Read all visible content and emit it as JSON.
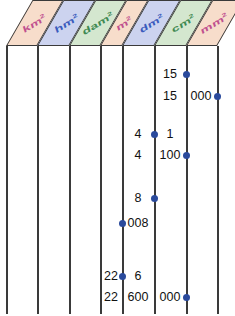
{
  "figure": {
    "dot_color": "#2a4a9c",
    "line_color": "#3a3a3a",
    "text_color": "#111111"
  },
  "header": {
    "units": [
      {
        "id": "km2",
        "base": "km",
        "exponent": "2",
        "fill": "#f7ddcb",
        "text_color": "#c0508f"
      },
      {
        "id": "hm2",
        "base": "hm",
        "exponent": "2",
        "fill": "#ccd3ef",
        "text_color": "#3a5bbd"
      },
      {
        "id": "dam2",
        "base": "dam",
        "exponent": "2",
        "fill": "#d4e7cf",
        "text_color": "#3f8a52"
      },
      {
        "id": "m2",
        "base": "m",
        "exponent": "2",
        "fill": "#f7ddcb",
        "text_color": "#c0508f"
      },
      {
        "id": "dm2",
        "base": "dm",
        "exponent": "2",
        "fill": "#ccd3ef",
        "text_color": "#3a5bbd"
      },
      {
        "id": "cm2",
        "base": "cm",
        "exponent": "2",
        "fill": "#d4e7cf",
        "text_color": "#3f8a52"
      },
      {
        "id": "mm2",
        "base": "mm",
        "exponent": "2",
        "fill": "#f7ddcb",
        "text_color": "#c0508f"
      }
    ]
  },
  "grid": {
    "column_line_x": [
      6,
      37,
      69,
      100,
      122,
      154,
      186,
      217
    ],
    "column_centers": [
      21,
      53,
      84,
      111,
      138,
      170,
      201
    ]
  },
  "rows": [
    {
      "id": "row-15",
      "y": 20,
      "cells": [
        {
          "text": "15",
          "x": 170
        }
      ],
      "dot_x": 186
    },
    {
      "id": "row-15-000",
      "y": 42,
      "cells": [
        {
          "text": "15",
          "x": 170
        },
        {
          "text": "000",
          "x": 201
        }
      ],
      "dot_x": 217
    },
    {
      "id": "row-4-1",
      "y": 80,
      "cells": [
        {
          "text": "4",
          "x": 138
        },
        {
          "text": "1",
          "x": 170
        }
      ],
      "dot_x": 154
    },
    {
      "id": "row-4-100",
      "y": 101,
      "cells": [
        {
          "text": "4",
          "x": 138
        },
        {
          "text": "100",
          "x": 170
        }
      ],
      "dot_x": 186
    },
    {
      "id": "row-8",
      "y": 144,
      "cells": [
        {
          "text": "8",
          "x": 138
        }
      ],
      "dot_x": 154
    },
    {
      "id": "row-008",
      "y": 169,
      "cells": [
        {
          "text": "008",
          "x": 138
        }
      ],
      "dot_x": 122
    },
    {
      "id": "row-22-6",
      "y": 222,
      "cells": [
        {
          "text": "22",
          "x": 111
        },
        {
          "text": "6",
          "x": 138
        }
      ],
      "dot_x": 122
    },
    {
      "id": "row-22-600-000",
      "y": 243,
      "cells": [
        {
          "text": "22",
          "x": 111
        },
        {
          "text": "600",
          "x": 138
        },
        {
          "text": "000",
          "x": 170
        }
      ],
      "dot_x": 186
    }
  ]
}
